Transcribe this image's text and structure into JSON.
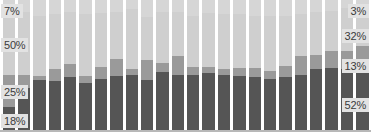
{
  "chart_data": {
    "type": "bar",
    "subtype": "stacked-bar-100-percent",
    "title": "",
    "subtitle": "",
    "xlabel": "",
    "ylabel": "",
    "ylim": [
      0,
      100
    ],
    "grid": false,
    "legend": "none",
    "axis_visible": {
      "x": true,
      "y": false
    },
    "tick_labels": {
      "x": [],
      "y": []
    },
    "stack_order": "top-to-bottom",
    "series": [
      {
        "name": "segment-1-top",
        "color": "#d6d6d6",
        "values": [
          7,
          9,
          12,
          11,
          9,
          11,
          10,
          9,
          7,
          13,
          9,
          9,
          12,
          10,
          11,
          11,
          12,
          12,
          12,
          11,
          9,
          8,
          6,
          3
        ]
      },
      {
        "name": "segment-2",
        "color": "#cfcfcf",
        "values": [
          50,
          48,
          46,
          42,
          40,
          47,
          41,
          36,
          46,
          33,
          39,
          34,
          39,
          41,
          42,
          41,
          40,
          42,
          38,
          32,
          33,
          31,
          33,
          32
        ]
      },
      {
        "name": "segment-3",
        "color": "#9a9a9a",
        "values": [
          25,
          10,
          3,
          9,
          10,
          5,
          9,
          13,
          4,
          15,
          7,
          14,
          6,
          5,
          4,
          6,
          7,
          6,
          9,
          14,
          11,
          13,
          14,
          13
        ]
      },
      {
        "name": "segment-4-bottom",
        "color": "#555555",
        "values": [
          18,
          33,
          39,
          38,
          41,
          37,
          40,
          42,
          43,
          39,
          45,
          43,
          43,
          44,
          43,
          42,
          41,
          40,
          41,
          43,
          47,
          48,
          47,
          52
        ]
      }
    ],
    "categories": [
      "1",
      "2",
      "3",
      "4",
      "5",
      "6",
      "7",
      "8",
      "9",
      "10",
      "11",
      "12",
      "13",
      "14",
      "15",
      "16",
      "17",
      "18",
      "19",
      "20",
      "21",
      "22",
      "23",
      "24"
    ],
    "annotations": {
      "first_bar_labels": [
        "7%",
        "50%",
        "25%",
        "18%"
      ],
      "last_bar_labels": [
        "3%",
        "32%",
        "13%",
        "52%"
      ]
    }
  },
  "colors": {
    "segment_top": "#d6d6d6",
    "segment_upper_mid": "#cfcfcf",
    "segment_lower_mid": "#9a9a9a",
    "segment_bottom": "#555555",
    "axis": "#b8b8b8",
    "label_bg": "#e2e2e2",
    "label_text": "#3b3b3b",
    "background": "#ffffff"
  },
  "labels": {
    "left": [
      {
        "text": "7%"
      },
      {
        "text": "50%"
      },
      {
        "text": "25%"
      },
      {
        "text": "18%"
      }
    ],
    "right": [
      {
        "text": "3%"
      },
      {
        "text": "32%"
      },
      {
        "text": "13%"
      },
      {
        "text": "52%"
      }
    ]
  }
}
